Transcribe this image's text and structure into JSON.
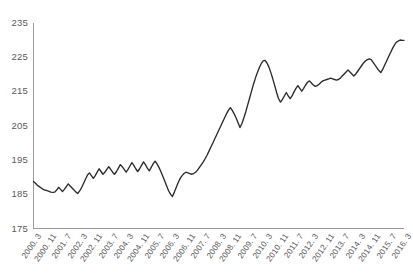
{
  "chart_data": {
    "type": "line",
    "title": "",
    "subtitle": "",
    "xlabel": "",
    "ylabel": "",
    "ylim": [
      175,
      235
    ],
    "yticks": [
      175,
      185,
      195,
      205,
      215,
      225,
      235
    ],
    "grid": false,
    "legend": null,
    "line_color": "#2b2b2b",
    "axis_color": "#9a9a9a",
    "tick_label_color": "#5a5a5a",
    "xtick_labels": [
      "2000. 3",
      "2000. 11",
      "2001. 7",
      "2002. 3",
      "2002. 11",
      "2003. 7",
      "2004. 3",
      "2004. 11",
      "2005. 7",
      "2006. 3",
      "2006. 11",
      "2007. 7",
      "2008. 3",
      "2008. 11",
      "2009. 7",
      "2010. 3",
      "2010. 11",
      "2011. 7",
      "2012. 3",
      "2012. 11",
      "2013. 7",
      "2014. 3",
      "2014. 11",
      "2015. 7",
      "2016. 3"
    ],
    "xtick_interval_months": 8,
    "x_start": "2000. 3",
    "x_end": "2016. 3",
    "n_points": 193,
    "values": [
      188.7,
      188.2,
      187.6,
      187.2,
      186.8,
      186.4,
      186.2,
      186.0,
      185.8,
      185.6,
      185.5,
      185.6,
      186.2,
      187.0,
      186.4,
      185.8,
      186.4,
      187.2,
      188.0,
      187.4,
      186.8,
      186.2,
      185.6,
      185.2,
      186.0,
      187.0,
      188.2,
      189.4,
      190.6,
      191.2,
      190.4,
      189.6,
      190.4,
      191.4,
      192.4,
      191.6,
      190.8,
      191.4,
      192.2,
      193.0,
      192.2,
      191.4,
      190.8,
      191.6,
      192.6,
      193.6,
      193.0,
      192.2,
      191.4,
      192.2,
      193.2,
      194.2,
      193.4,
      192.4,
      191.6,
      192.4,
      193.4,
      194.4,
      193.6,
      192.6,
      191.8,
      192.8,
      193.8,
      194.6,
      193.8,
      192.8,
      191.6,
      190.2,
      188.8,
      187.4,
      186.0,
      185.0,
      184.3,
      185.6,
      187.0,
      188.4,
      189.6,
      190.4,
      191.0,
      191.4,
      191.2,
      191.0,
      190.8,
      191.0,
      191.4,
      192.0,
      192.8,
      193.6,
      194.4,
      195.4,
      196.4,
      197.6,
      198.8,
      200.0,
      201.2,
      202.4,
      203.6,
      204.8,
      206.0,
      207.2,
      208.4,
      209.4,
      210.2,
      209.4,
      208.4,
      207.2,
      205.8,
      204.4,
      205.6,
      207.2,
      209.0,
      211.0,
      213.0,
      215.0,
      217.0,
      218.8,
      220.4,
      221.8,
      223.0,
      223.8,
      224.0,
      223.2,
      222.0,
      220.4,
      218.6,
      216.6,
      214.6,
      212.8,
      211.8,
      212.6,
      213.6,
      214.6,
      213.6,
      212.8,
      213.6,
      214.8,
      215.8,
      216.6,
      215.8,
      215.0,
      215.8,
      216.8,
      217.6,
      218.0,
      217.4,
      216.8,
      216.4,
      216.6,
      217.0,
      217.6,
      218.0,
      218.2,
      218.4,
      218.6,
      218.8,
      218.6,
      218.4,
      218.2,
      218.4,
      218.8,
      219.4,
      220.0,
      220.6,
      221.2,
      220.6,
      220.0,
      219.4,
      220.0,
      220.8,
      221.6,
      222.4,
      223.2,
      223.8,
      224.2,
      224.4,
      224.2,
      223.4,
      222.6,
      221.8,
      221.0,
      220.4,
      221.4,
      222.6,
      223.8,
      225.0,
      226.2,
      227.4,
      228.4,
      229.2,
      229.6,
      229.9,
      229.8,
      229.8
    ]
  }
}
